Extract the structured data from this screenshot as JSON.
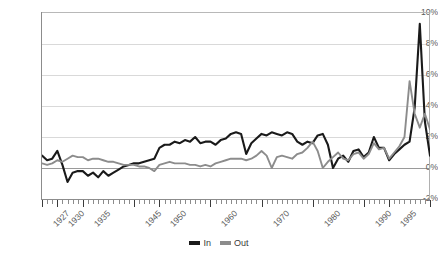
{
  "chart_data": {
    "type": "line",
    "title": "",
    "xlabel": "",
    "ylabel": "",
    "ylim": [
      -2,
      10
    ],
    "xlim": [
      1927,
      2003
    ],
    "ytick_labels": [
      "10%",
      "8%",
      "6%",
      "4%",
      "2%",
      "0%",
      "-2%"
    ],
    "ytick_values": [
      10,
      8,
      6,
      4,
      2,
      0,
      -2
    ],
    "ytick_step": 2,
    "grid": "horizontal",
    "legend_position": "bottom-center",
    "xtick_labels": [
      "1927",
      "1930",
      "1935",
      "1945",
      "1950",
      "1960",
      "1970",
      "1980",
      "1990",
      "1995",
      "2003"
    ],
    "xtick_values": [
      1927,
      1930,
      1935,
      1945,
      1950,
      1960,
      1970,
      1980,
      1990,
      1995,
      2003
    ],
    "x": [
      1927,
      1928,
      1929,
      1930,
      1931,
      1932,
      1933,
      1934,
      1935,
      1936,
      1937,
      1938,
      1939,
      1940,
      1941,
      1942,
      1943,
      1944,
      1945,
      1946,
      1947,
      1948,
      1949,
      1950,
      1951,
      1952,
      1953,
      1954,
      1955,
      1956,
      1957,
      1958,
      1959,
      1960,
      1961,
      1962,
      1963,
      1964,
      1965,
      1966,
      1967,
      1968,
      1969,
      1970,
      1971,
      1972,
      1973,
      1974,
      1975,
      1976,
      1977,
      1978,
      1979,
      1980,
      1981,
      1982,
      1983,
      1984,
      1985,
      1986,
      1987,
      1988,
      1989,
      1990,
      1991,
      1992,
      1993,
      1994,
      1995,
      1996,
      1997,
      1998,
      1999,
      2000,
      2001,
      2002,
      2003
    ],
    "series": [
      {
        "name": "In",
        "color": "#1a1a1a",
        "values": [
          0.8,
          0.5,
          0.6,
          1.1,
          0.2,
          -0.9,
          -0.3,
          -0.2,
          -0.2,
          -0.5,
          -0.3,
          -0.6,
          -0.2,
          -0.5,
          -0.3,
          -0.1,
          0.1,
          0.2,
          0.3,
          0.3,
          0.4,
          0.5,
          0.6,
          1.3,
          1.5,
          1.5,
          1.7,
          1.6,
          1.8,
          1.7,
          2.0,
          1.6,
          1.7,
          1.7,
          1.5,
          1.8,
          1.9,
          2.2,
          2.3,
          2.2,
          0.9,
          1.6,
          1.9,
          2.2,
          2.1,
          2.3,
          2.2,
          2.1,
          2.3,
          2.2,
          1.7,
          1.5,
          1.7,
          1.6,
          2.1,
          2.2,
          1.5,
          0.0,
          0.6,
          0.8,
          0.4,
          1.1,
          1.2,
          0.7,
          1.0,
          2.0,
          1.3,
          1.3,
          0.5,
          0.9,
          1.2,
          1.5,
          1.7,
          3.9,
          9.3,
          3.0,
          0.8
        ]
      },
      {
        "name": "Out",
        "color": "#8c8c8c",
        "values": [
          0.3,
          0.2,
          0.3,
          0.5,
          0.4,
          0.6,
          0.8,
          0.7,
          0.7,
          0.5,
          0.6,
          0.6,
          0.5,
          0.4,
          0.4,
          0.3,
          0.2,
          0.2,
          0.2,
          0.1,
          0.1,
          0.0,
          -0.2,
          0.2,
          0.3,
          0.4,
          0.3,
          0.3,
          0.3,
          0.2,
          0.2,
          0.1,
          0.2,
          0.1,
          0.3,
          0.4,
          0.5,
          0.6,
          0.6,
          0.6,
          0.5,
          0.6,
          0.8,
          1.1,
          0.8,
          0.0,
          0.7,
          0.8,
          0.7,
          0.6,
          0.9,
          1.0,
          1.3,
          1.7,
          1.1,
          0.0,
          0.4,
          0.7,
          1.0,
          0.6,
          0.5,
          0.9,
          1.0,
          0.6,
          0.9,
          1.6,
          1.2,
          1.3,
          0.6,
          1.0,
          1.4,
          2.0,
          5.6,
          3.5,
          2.6,
          3.5,
          2.5
        ]
      }
    ]
  },
  "legend": {
    "entries": [
      {
        "label": "In",
        "color": "#1a1a1a"
      },
      {
        "label": "Out",
        "color": "#8c8c8c"
      }
    ]
  }
}
